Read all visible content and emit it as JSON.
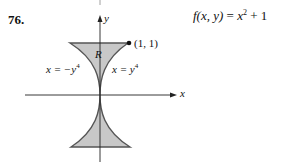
{
  "problem": {
    "number": "76.",
    "function_label": "f(x, y) = x² + 1",
    "function_parts": {
      "lhs": "f(x, y)",
      "eq": " = ",
      "base": "x",
      "exp": "2",
      "rest": " + 1"
    }
  },
  "figure": {
    "axis_x_label": "x",
    "axis_y_label": "y",
    "region_label": "R",
    "point_label": "(1, 1)",
    "left_curve": {
      "prefix": "x = −y",
      "exp": "4"
    },
    "right_curve": {
      "prefix": "x = y",
      "exp": "4"
    },
    "colors": {
      "fill": "#c8c8c8",
      "stroke": "#555555",
      "axis": "#222222"
    }
  }
}
